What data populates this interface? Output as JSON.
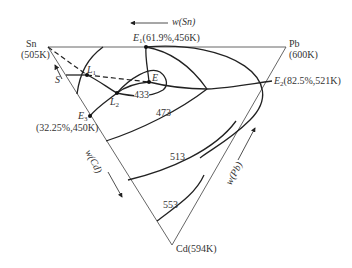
{
  "diagram": {
    "type": "ternary-phase-diagram",
    "vertices": {
      "sn": {
        "name": "Sn",
        "temp": "(505K)"
      },
      "pb": {
        "name": "Pb",
        "temp": "(600K)"
      },
      "cd": {
        "label": "Cd(594K)"
      }
    },
    "axes": {
      "top": "w(Sn)",
      "left": "w(Cd)",
      "right": "w(Pb)"
    },
    "points": {
      "e1": {
        "sym": "E",
        "sub": "1",
        "value": "(61.9%,456K)"
      },
      "e2": {
        "sym": "E",
        "sub": "2",
        "value": "(82.5%,521K)"
      },
      "e3": {
        "sym": "E",
        "sub": "3",
        "value": "(32.25%,450K)"
      },
      "e": {
        "sym": "E"
      },
      "l1": {
        "sym": "L",
        "sub": "1"
      },
      "l2": {
        "sym": "L",
        "sub": "2"
      },
      "s": {
        "sym": "S"
      }
    },
    "isotherms": [
      "433",
      "473",
      "513",
      "553"
    ],
    "colors": {
      "line": "#222222",
      "edge": "#555555",
      "text": "#333333"
    }
  }
}
